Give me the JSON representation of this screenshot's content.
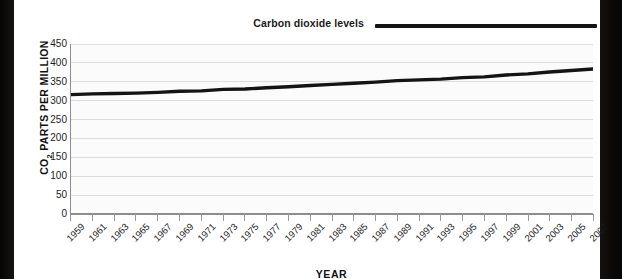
{
  "legend": {
    "label": "Carbon dioxide levels",
    "line_color": "#141414"
  },
  "axes": {
    "y_title_main": "CO",
    "y_title_sub": "2",
    "y_title_rest": " PARTS PER MILLION",
    "x_title": "YEAR"
  },
  "chart_data": {
    "type": "line",
    "title": "",
    "xlabel": "YEAR",
    "ylabel": "CO2 PARTS PER MILLION",
    "ylim": [
      0,
      450
    ],
    "ytick_values": [
      0,
      50,
      100,
      150,
      200,
      250,
      300,
      350,
      400,
      450
    ],
    "ytick_labels": [
      "0",
      "50",
      "100",
      "150",
      "200",
      "250",
      "300",
      "350",
      "400",
      "450"
    ],
    "grid": true,
    "legend_position": "top-right",
    "categories": [
      "1959",
      "1961",
      "1963",
      "1965",
      "1967",
      "1969",
      "1971",
      "1973",
      "1975",
      "1977",
      "1979",
      "1981",
      "1983",
      "1985",
      "1987",
      "1989",
      "1991",
      "1993",
      "1995",
      "1997",
      "1999",
      "2001",
      "2003",
      "2005",
      "2007"
    ],
    "series": [
      {
        "name": "Carbon dioxide levels",
        "color": "#141414",
        "values": [
          316,
          318,
          319,
          320,
          322,
          325,
          326,
          330,
          331,
          334,
          337,
          340,
          343,
          346,
          349,
          353,
          355,
          357,
          361,
          363,
          368,
          371,
          376,
          380,
          384
        ]
      }
    ]
  }
}
